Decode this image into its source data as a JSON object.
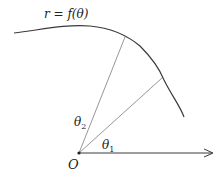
{
  "diagram": {
    "curve_label": "r = f(θ)",
    "origin_label": "O",
    "angle_labels": {
      "theta1": {
        "symbol": "θ",
        "subscript": "1"
      },
      "theta2": {
        "symbol": "θ",
        "subscript": "2"
      }
    },
    "colors": {
      "curve": "#3a3a3a",
      "rays": "#8a8a8a",
      "axis": "#3a3a3a",
      "text": "#222222"
    }
  }
}
